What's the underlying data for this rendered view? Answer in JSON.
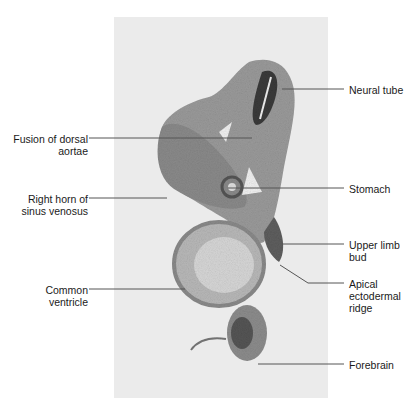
{
  "figure": {
    "type": "histology-micrograph",
    "labels_right": [
      {
        "id": "neural-tube",
        "text": "Neural tube"
      },
      {
        "id": "stomach",
        "text": "Stomach"
      },
      {
        "id": "upper-limb-bud",
        "text": "Upper limb\nbud"
      },
      {
        "id": "apical-ectodermal-ridge",
        "text": "Apical\nectodermal\nridge"
      },
      {
        "id": "forebrain",
        "text": "Forebrain"
      }
    ],
    "labels_left": [
      {
        "id": "fusion-of-dorsal-aortae",
        "text": "Fusion of dorsal\naortae"
      },
      {
        "id": "right-horn-of-sinus-venosus",
        "text": "Right horn of\nsinus venosus"
      },
      {
        "id": "common-ventricle",
        "text": "Common\nventricle"
      }
    ],
    "colors": {
      "background": "#ffffff",
      "panel": "#ebebeb",
      "tissue_light": "#a8a8a8",
      "tissue_dark": "#5e5e5e",
      "leader_line": "#555555",
      "text": "#1a1a1a"
    }
  }
}
